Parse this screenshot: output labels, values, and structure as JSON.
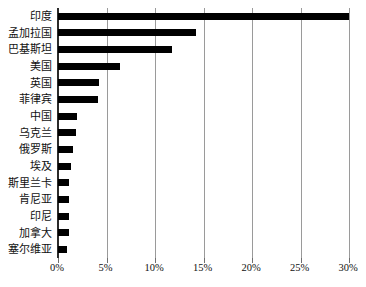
{
  "chart_data": {
    "type": "bar",
    "orientation": "horizontal",
    "title": "",
    "subtitle": "",
    "xlabel": "",
    "ylabel": "",
    "xlim": [
      0,
      30
    ],
    "ylim": null,
    "grid": true,
    "legend": null,
    "legend_position": "none",
    "bar_color": "#000000",
    "gridline_color": "#9a9a9a",
    "axis_color": "#2b2b2b",
    "categories": [
      "印度",
      "孟加拉国",
      "巴基斯坦",
      "美国",
      "英国",
      "菲律宾",
      "中国",
      "乌克兰",
      "俄罗斯",
      "埃及",
      "斯里兰卡",
      "肯尼亚",
      "印尼",
      "加拿大",
      "塞尔维亚"
    ],
    "values": [
      30.0,
      14.2,
      11.8,
      6.4,
      4.2,
      4.1,
      2.0,
      1.9,
      1.5,
      1.3,
      1.1,
      1.1,
      1.1,
      1.1,
      0.9
    ],
    "value_unit": "%",
    "xticks": [
      0,
      5,
      10,
      15,
      20,
      25,
      30
    ],
    "xtick_labels": [
      "0%",
      "5%",
      "10%",
      "15%",
      "20%",
      "25%",
      "30%"
    ]
  }
}
